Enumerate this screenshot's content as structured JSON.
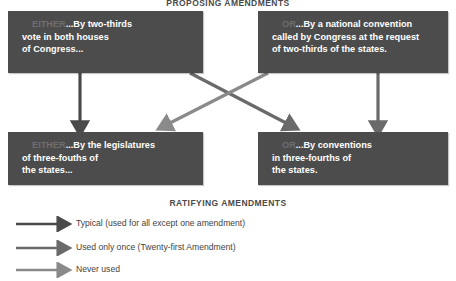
{
  "diagram": {
    "sections": {
      "proposing_title": "PROPOSING AMENDMENTS",
      "ratifying_title": "RATIFYING AMENDMENTS"
    },
    "boxes": {
      "top_left": {
        "prefix": "EITHER",
        "line1": "...By two-thirds",
        "line2": "vote in both houses",
        "line3": "of Congress..."
      },
      "top_right": {
        "prefix": "OR",
        "line1": "...By a national convention",
        "line2": "called by Congress at the request",
        "line3": "of two-thirds of the states."
      },
      "bottom_left": {
        "prefix": "EITHER",
        "line1": "...By the legislatures",
        "line2": "of three-fouths of",
        "line3": "the states..."
      },
      "bottom_right": {
        "prefix": "OR",
        "line1": "...By conventions",
        "line2": "in three-fourths of",
        "line3": "the states."
      }
    },
    "legend": {
      "items": [
        {
          "label": "Typical (used for all except one amendment)",
          "color": "#4a4a4a"
        },
        {
          "label": "Used only once (Twenty-first Amendment)",
          "color": "#6a6a6a"
        },
        {
          "label": "Never used",
          "color": "#8a8a8a"
        }
      ]
    },
    "colors": {
      "box_fill": "#4c4c4c",
      "box_text": "#ffffff",
      "box_prefix_text": "#6e6e6e",
      "heading_text": "#4a4a4a",
      "arrow_typical": "#4a4a4a",
      "arrow_once": "#6a6a6a",
      "arrow_never": "#8a8a8a",
      "background": "#ffffff"
    }
  }
}
